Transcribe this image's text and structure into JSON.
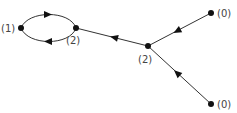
{
  "diagram": {
    "type": "directed-graph",
    "nodes": [
      {
        "id": "n1",
        "label": "(1)",
        "x": 21,
        "y": 28
      },
      {
        "id": "n2a",
        "label": "(2)",
        "x": 76,
        "y": 28
      },
      {
        "id": "n2b",
        "label": "(2)",
        "x": 148,
        "y": 46
      },
      {
        "id": "n0a",
        "label": "(0)",
        "x": 211,
        "y": 13
      },
      {
        "id": "n0b",
        "label": "(0)",
        "x": 211,
        "y": 104
      }
    ],
    "edges": [
      {
        "from": "n1",
        "to": "n2a",
        "shape": "upper-arc"
      },
      {
        "from": "n2a",
        "to": "n1",
        "shape": "lower-arc"
      },
      {
        "from": "n2b",
        "to": "n2a",
        "shape": "line"
      },
      {
        "from": "n0a",
        "to": "n2b",
        "shape": "line"
      },
      {
        "from": "n0b",
        "to": "n2b",
        "shape": "line"
      }
    ],
    "colors": {
      "edge": "#333333",
      "node": "#111111",
      "label": "#444444"
    }
  }
}
